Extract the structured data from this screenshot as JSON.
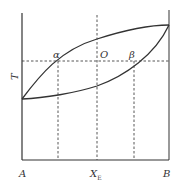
{
  "diagram": {
    "type": "binary-phase-diagram",
    "y_axis_label": "T",
    "x_axis_labels": {
      "left": "A",
      "middle_main": "X",
      "middle_sub": "E",
      "right": "B"
    },
    "point_labels": {
      "alpha": "α",
      "origin": "O",
      "beta": "β"
    },
    "colors": {
      "line": "#333333",
      "dashed": "#444444",
      "background": "#ffffff"
    }
  }
}
